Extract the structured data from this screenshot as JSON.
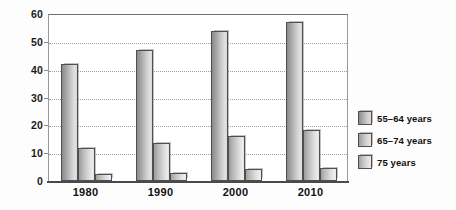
{
  "chart_data": {
    "type": "bar",
    "title": "",
    "xlabel": "",
    "ylabel": "",
    "categories": [
      "1980",
      "1990",
      "2000",
      "2010"
    ],
    "series": [
      {
        "name": "55–64 years",
        "values": [
          42,
          47,
          54,
          57
        ]
      },
      {
        "name": "65–74 years",
        "values": [
          12,
          13.5,
          16,
          18.5
        ]
      },
      {
        "name": "75 years",
        "values": [
          2.5,
          3,
          4.2,
          4.5
        ]
      }
    ],
    "ylim": [
      0,
      60
    ],
    "ytick_labels": [
      "60",
      "50",
      "40",
      "30",
      "20",
      "10",
      "0"
    ],
    "ytick_values": [
      60,
      50,
      40,
      30,
      20,
      10,
      0
    ],
    "gridlines": [
      50,
      40,
      30,
      20,
      10
    ],
    "grid": true,
    "legend_position": "right"
  },
  "legend": {
    "entries": [
      {
        "label": "55–64 years",
        "swatch": "legend-swatch-55-64"
      },
      {
        "label": "65–74 years",
        "swatch": "legend-swatch-65-74"
      },
      {
        "label": "75 years",
        "swatch": "legend-swatch-75-plus"
      }
    ]
  }
}
